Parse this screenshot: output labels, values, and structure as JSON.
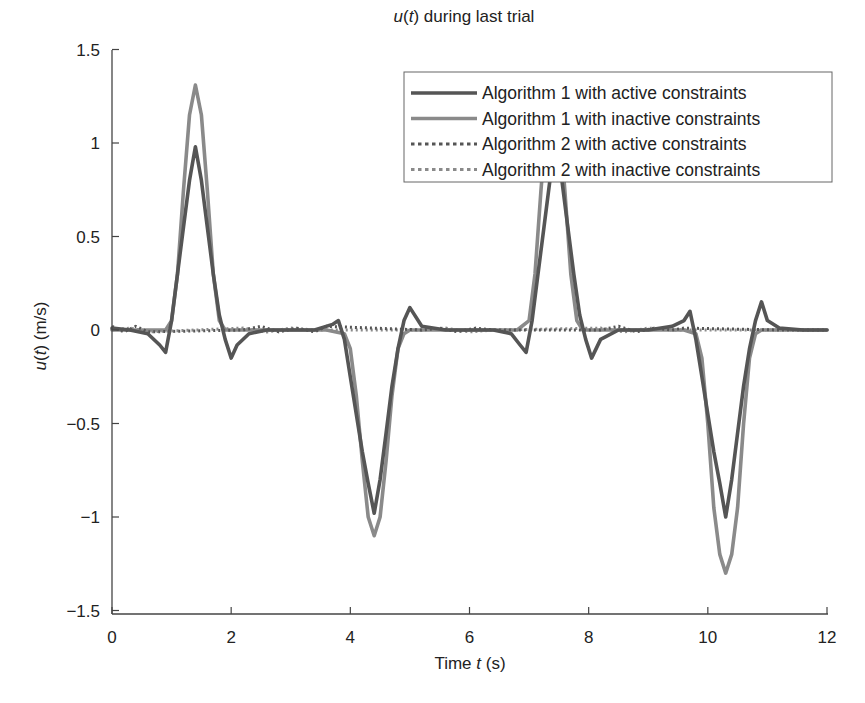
{
  "chart_data": {
    "type": "line",
    "title": "u(t) during last trial",
    "title_parts": {
      "var": "u",
      "arg": "t",
      "rest": " during last trial"
    },
    "xlabel": "Time t (s)",
    "xlabel_parts": {
      "pre": "Time ",
      "var": "t",
      "post": " (s)"
    },
    "ylabel": "u(t) (m/s)",
    "ylabel_parts": {
      "var": "u",
      "arg": "t",
      "post": " (m/s)"
    },
    "xlim": [
      0,
      12
    ],
    "ylim": [
      -1.5,
      1.5
    ],
    "xticks": [
      0,
      2,
      4,
      6,
      8,
      10,
      12
    ],
    "xtick_labels": [
      "0",
      "2",
      "4",
      "6",
      "8",
      "10",
      "12"
    ],
    "yticks": [
      1.5,
      1,
      0.5,
      0,
      -0.5,
      -1,
      -1.5
    ],
    "ytick_labels": [
      "1.5",
      "1",
      "0.5",
      "0",
      "−0.5",
      "−1",
      "−1.5"
    ],
    "grid": false,
    "legend_position": "upper right",
    "series": [
      {
        "name": "Algorithm 1 with active constraints",
        "color": "#555555",
        "style": "solid",
        "x": [
          0,
          0.3,
          0.6,
          0.8,
          0.9,
          1.0,
          1.1,
          1.2,
          1.3,
          1.4,
          1.5,
          1.6,
          1.7,
          1.8,
          1.9,
          2.0,
          2.1,
          2.3,
          2.6,
          3.0,
          3.4,
          3.7,
          3.8,
          3.9,
          4.0,
          4.1,
          4.2,
          4.3,
          4.4,
          4.5,
          4.6,
          4.7,
          4.8,
          4.9,
          5.0,
          5.2,
          5.6,
          6.0,
          6.4,
          6.7,
          6.85,
          6.95,
          7.05,
          7.15,
          7.25,
          7.35,
          7.45,
          7.55,
          7.65,
          7.75,
          7.85,
          7.95,
          8.05,
          8.2,
          8.5,
          9.0,
          9.4,
          9.6,
          9.7,
          9.8,
          9.9,
          10.0,
          10.1,
          10.2,
          10.3,
          10.4,
          10.5,
          10.6,
          10.7,
          10.8,
          10.9,
          11.0,
          11.2,
          11.6,
          12.0
        ],
        "values": [
          0.01,
          0.0,
          -0.02,
          -0.08,
          -0.12,
          0.05,
          0.3,
          0.55,
          0.8,
          0.98,
          0.8,
          0.55,
          0.3,
          0.08,
          -0.05,
          -0.15,
          -0.08,
          -0.02,
          0.0,
          0.0,
          0.0,
          0.03,
          0.05,
          -0.05,
          -0.25,
          -0.45,
          -0.65,
          -0.82,
          -0.98,
          -0.8,
          -0.55,
          -0.3,
          -0.1,
          0.05,
          0.12,
          0.02,
          0.0,
          0.0,
          0.0,
          -0.02,
          -0.08,
          -0.12,
          0.05,
          0.3,
          0.55,
          0.8,
          0.98,
          0.8,
          0.55,
          0.3,
          0.08,
          -0.05,
          -0.15,
          -0.05,
          0.0,
          0.0,
          0.02,
          0.05,
          0.1,
          -0.05,
          -0.25,
          -0.45,
          -0.65,
          -0.82,
          -1.0,
          -0.8,
          -0.55,
          -0.3,
          -0.1,
          0.05,
          0.15,
          0.05,
          0.01,
          0.0,
          0.0
        ]
      },
      {
        "name": "Algorithm 1 with inactive constraints",
        "color": "#8a8a8a",
        "style": "solid",
        "x": [
          0,
          0.5,
          0.9,
          1.0,
          1.1,
          1.2,
          1.3,
          1.4,
          1.5,
          1.6,
          1.7,
          1.8,
          1.9,
          2.0,
          2.5,
          3.0,
          3.6,
          3.9,
          4.0,
          4.1,
          4.2,
          4.3,
          4.4,
          4.5,
          4.6,
          4.7,
          4.8,
          4.9,
          5.0,
          5.5,
          6.0,
          6.8,
          7.0,
          7.1,
          7.2,
          7.3,
          7.4,
          7.5,
          7.6,
          7.7,
          7.8,
          7.9,
          8.0,
          8.5,
          9.0,
          9.6,
          9.8,
          9.9,
          10.0,
          10.1,
          10.2,
          10.3,
          10.4,
          10.5,
          10.6,
          10.7,
          10.8,
          10.9,
          11.0,
          11.5,
          12.0
        ],
        "values": [
          0.0,
          0.0,
          0.0,
          0.05,
          0.3,
          0.75,
          1.15,
          1.31,
          1.15,
          0.75,
          0.3,
          0.05,
          0.0,
          0.0,
          0.0,
          0.0,
          0.0,
          -0.02,
          -0.1,
          -0.35,
          -0.7,
          -1.0,
          -1.1,
          -1.0,
          -0.7,
          -0.35,
          -0.1,
          -0.02,
          0.0,
          0.0,
          0.0,
          0.0,
          0.05,
          0.3,
          0.75,
          1.15,
          1.31,
          1.15,
          0.75,
          0.3,
          0.05,
          0.0,
          0.0,
          0.0,
          0.0,
          0.0,
          -0.02,
          -0.15,
          -0.5,
          -0.95,
          -1.2,
          -1.3,
          -1.2,
          -0.95,
          -0.5,
          -0.15,
          -0.02,
          0.0,
          0.0,
          0.0,
          0.0
        ]
      },
      {
        "name": "Algorithm 2 with active constraints",
        "color": "#555555",
        "style": "dotted",
        "x": [
          0,
          0.2,
          0.4,
          0.6,
          2.2,
          2.5,
          2.8,
          3.1,
          3.4,
          3.6,
          5.2,
          5.5,
          5.8,
          6.1,
          6.4,
          6.6,
          8.2,
          8.5,
          8.8,
          9.1,
          9.4,
          9.6,
          11.2,
          11.6,
          12.0
        ],
        "values": [
          0.02,
          -0.01,
          0.02,
          -0.01,
          0.0,
          0.02,
          -0.01,
          0.01,
          -0.01,
          0.02,
          0.0,
          0.01,
          -0.01,
          0.01,
          0.0,
          0.0,
          0.0,
          0.02,
          -0.01,
          0.01,
          0.0,
          0.01,
          0.0,
          0.0,
          0.0
        ]
      },
      {
        "name": "Algorithm 2 with inactive constraints",
        "color": "#8a8a8a",
        "style": "dotted",
        "x": [
          0,
          0.3,
          0.6,
          2.2,
          2.6,
          3.0,
          3.4,
          5.2,
          5.6,
          6.0,
          6.4,
          8.2,
          8.6,
          9.0,
          9.4,
          11.2,
          12.0
        ],
        "values": [
          0.0,
          0.01,
          -0.01,
          0.01,
          -0.01,
          0.01,
          0.0,
          0.0,
          0.01,
          -0.01,
          0.0,
          0.01,
          -0.01,
          0.01,
          0.0,
          0.0,
          0.0
        ]
      }
    ]
  }
}
